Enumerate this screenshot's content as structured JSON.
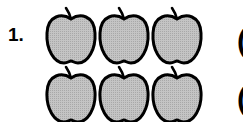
{
  "problem": {
    "number_label": "1.",
    "rows": [
      {
        "apples": 3,
        "answer_open": "("
      },
      {
        "apples": 3,
        "answer_open": "("
      }
    ],
    "icon": "apple-icon",
    "colors": {
      "fill": "#b8b8b8",
      "outline": "#000000",
      "background": "#ffffff"
    }
  }
}
